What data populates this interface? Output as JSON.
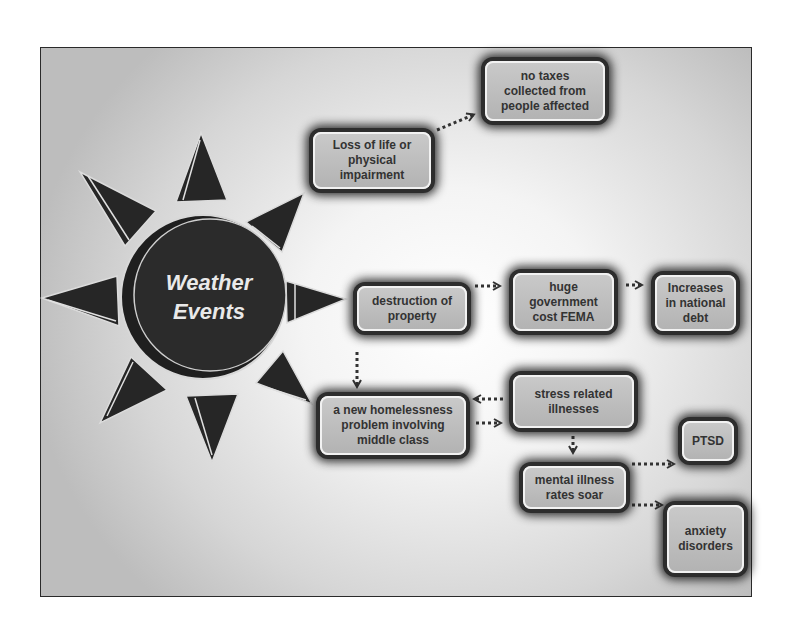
{
  "diagram": {
    "center": {
      "line1": "Weather",
      "line2": "Events"
    },
    "nodes": {
      "loss_of_life": "Loss of life or\nphysical\nimpairment",
      "no_taxes": "no taxes\ncollected from\npeople affected",
      "destruction": "destruction of\nproperty",
      "gov_cost": "huge\ngovernment\ncost FEMA",
      "national_debt": "Increases\nin national\ndebt",
      "homelessness": "a new homelessness\nproblem involving\nmiddle class",
      "stress": "stress related\nillnesses",
      "mental_illness": "mental illness\nrates soar",
      "ptsd": "PTSD",
      "anxiety": "anxiety\ndisorders"
    },
    "edges": [
      {
        "from": "Weather Events",
        "to": "Loss of life or physical impairment"
      },
      {
        "from": "Weather Events",
        "to": "destruction of property"
      },
      {
        "from": "Weather Events",
        "to": "a new homelessness problem involving middle class"
      },
      {
        "from": "Loss of life or physical impairment",
        "to": "no taxes collected from people affected"
      },
      {
        "from": "destruction of property",
        "to": "huge government cost FEMA"
      },
      {
        "from": "huge government cost FEMA",
        "to": "Increases in national debt"
      },
      {
        "from": "destruction of property",
        "to": "a new homelessness problem involving middle class"
      },
      {
        "from": "a new homelessness problem involving middle class",
        "to": "stress related illnesses"
      },
      {
        "from": "stress related illnesses",
        "to": "a new homelessness problem involving middle class"
      },
      {
        "from": "stress related illnesses",
        "to": "mental illness rates soar"
      },
      {
        "from": "mental illness rates soar",
        "to": "PTSD"
      },
      {
        "from": "mental illness rates soar",
        "to": "anxiety disorders"
      }
    ],
    "colors": {
      "node_fill": "#bebebe",
      "node_border": "#2d2d2d",
      "sun_fill": "#262626",
      "text": "#333333",
      "connector": "#333333"
    }
  }
}
